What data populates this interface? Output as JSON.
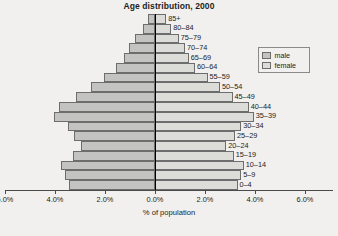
{
  "chart_data": {
    "type": "bar",
    "subtype": "population-pyramid",
    "title": "Age distribution, 2000",
    "xlabel": "% of population",
    "ylabel": "",
    "categories": [
      "0–4",
      "5–9",
      "10–14",
      "15–19",
      "20–24",
      "25–29",
      "30–34",
      "35–39",
      "40–44",
      "45–49",
      "50–54",
      "55–59",
      "60–64",
      "65–69",
      "70–74",
      "75–79",
      "80–84",
      "85+"
    ],
    "series": [
      {
        "name": "male",
        "values": [
          3.45,
          3.6,
          3.75,
          3.3,
          2.95,
          3.25,
          3.5,
          4.05,
          3.85,
          3.15,
          2.55,
          2.05,
          1.55,
          1.25,
          1.05,
          0.8,
          0.5,
          0.3
        ]
      },
      {
        "name": "female",
        "values": [
          3.3,
          3.45,
          3.55,
          3.15,
          2.85,
          3.2,
          3.45,
          3.95,
          3.75,
          3.1,
          2.6,
          2.1,
          1.6,
          1.35,
          1.2,
          0.95,
          0.65,
          0.45
        ]
      }
    ],
    "xticks": [
      "6.0%",
      "4.0%",
      "2.0%",
      "0.0%",
      "2.0%",
      "4.0%",
      "6.0%"
    ],
    "xtick_values": [
      -6,
      -4,
      -2,
      0,
      2,
      4,
      6
    ],
    "xlim": [
      -6.0,
      6.0
    ],
    "grid": false,
    "legend_position": "right",
    "legend_entries": [
      "male",
      "female"
    ],
    "colors": {
      "male": "#c3c3c1",
      "female": "#dcdcd8",
      "bar_border": "#6d6d6d",
      "axis": "#000000",
      "background": "#f1f0ee"
    }
  }
}
